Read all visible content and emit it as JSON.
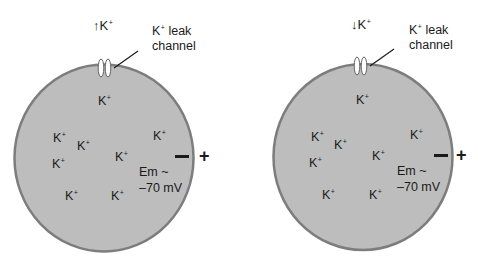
{
  "colors": {
    "cell_fill": "#bdbdbd",
    "cell_border": "#7d7d7d",
    "channel_fill": "#ffffff",
    "text": "#1a1a1a"
  },
  "panels": [
    {
      "id": "left",
      "flux_arrow": "↑",
      "flux_ion": "K",
      "flux_charge": "+",
      "channel_label_ion": "K",
      "channel_label_charge": "+",
      "channel_label_rest": " leak",
      "channel_label_line2": "channel",
      "ions": [
        {
          "ion": "K",
          "charge": "+"
        },
        {
          "ion": "K",
          "charge": "+"
        },
        {
          "ion": "K",
          "charge": "+"
        },
        {
          "ion": "K",
          "charge": "+"
        },
        {
          "ion": "K",
          "charge": "+"
        },
        {
          "ion": "K",
          "charge": "+"
        },
        {
          "ion": "K",
          "charge": "+"
        },
        {
          "ion": "K",
          "charge": "+"
        }
      ],
      "em_line1": "Em ~",
      "em_line2": "–70 mV",
      "inside_sign": "–",
      "outside_sign": "+"
    },
    {
      "id": "right",
      "flux_arrow": "↓",
      "flux_ion": "K",
      "flux_charge": "+",
      "channel_label_ion": "K",
      "channel_label_charge": "+",
      "channel_label_rest": " leak",
      "channel_label_line2": "channel",
      "ions": [
        {
          "ion": "K",
          "charge": "+"
        },
        {
          "ion": "K",
          "charge": "+"
        },
        {
          "ion": "K",
          "charge": "+"
        },
        {
          "ion": "K",
          "charge": "+"
        },
        {
          "ion": "K",
          "charge": "+"
        },
        {
          "ion": "K",
          "charge": "+"
        },
        {
          "ion": "K",
          "charge": "+"
        },
        {
          "ion": "K",
          "charge": "+"
        }
      ],
      "em_line1": "Em ~",
      "em_line2": "–70 mV",
      "inside_sign": "–",
      "outside_sign": "+"
    }
  ]
}
